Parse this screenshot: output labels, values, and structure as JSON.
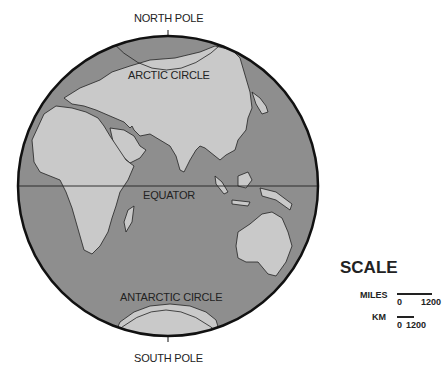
{
  "map": {
    "type": "globe-hemisphere",
    "labels": {
      "north_pole": "NORTH POLE",
      "arctic_circle": "ARCTIC CIRCLE",
      "equator": "EQUATOR",
      "antarctic_circle": "ANTARCTIC CIRCLE",
      "south_pole": "SOUTH POLE"
    },
    "colors": {
      "ocean": "#8e8e8e",
      "land": "#c9c9c9",
      "outline": "#111111"
    }
  },
  "scale": {
    "title": "SCALE",
    "miles": {
      "label": "MILES",
      "start": "0",
      "end": "1200"
    },
    "km": {
      "label": "KM",
      "start": "0",
      "end": "1200"
    }
  }
}
